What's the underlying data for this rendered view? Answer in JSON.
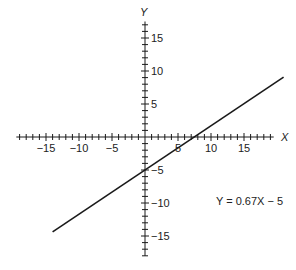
{
  "chart_data": {
    "type": "line",
    "title": "",
    "xlabel": "X",
    "ylabel": "Y",
    "xlim": [
      -19.5,
      19.5
    ],
    "ylim": [
      -18,
      17.5
    ],
    "grid": false,
    "legend": null,
    "x_ticks": [
      -15,
      -10,
      -5,
      5,
      10,
      15
    ],
    "y_ticks": [
      -15,
      -10,
      -5,
      5,
      10,
      15
    ],
    "x_tick_labels": [
      "−15",
      "−10",
      "−5",
      "5",
      "10",
      "15"
    ],
    "y_tick_labels": [
      "−15",
      "−10",
      "−5",
      "5",
      "10",
      "15"
    ],
    "minor_tick_step": 1,
    "series": [
      {
        "name": "Y = 0.67X − 5",
        "slope": 0.67,
        "intercept": -5,
        "x": [
          -14,
          21
        ],
        "y": [
          -14.38,
          9.07
        ],
        "color": "#1a1a1a"
      }
    ],
    "annotations": [
      {
        "text": "Y = 0.67X − 5",
        "x": 12,
        "y": -9
      }
    ]
  },
  "labels": {
    "x_axis": "X",
    "y_axis": "Y",
    "equation": "Y = 0.67X − 5"
  },
  "colors": {
    "axis": "#1a1a1a",
    "line": "#1a1a1a",
    "text": "#222222",
    "background": "#ffffff"
  }
}
